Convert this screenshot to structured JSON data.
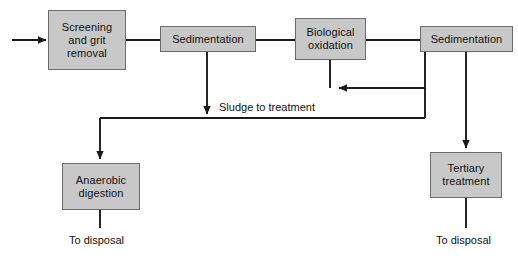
{
  "diagram": {
    "colors": {
      "box_fill": "#c8c8c8",
      "box_border": "#6b6b6b",
      "line": "#1a1a1a",
      "text": "#111111",
      "background": "#ffffff"
    },
    "nodes": [
      {
        "id": "screening-and-grit-removal",
        "label": "Screening\nand grit\nremoval",
        "x": 48,
        "y": 10,
        "w": 78,
        "h": 60
      },
      {
        "id": "sedimentation-primary",
        "label": "Sedimentation",
        "x": 160,
        "y": 26,
        "w": 96,
        "h": 26
      },
      {
        "id": "biological-oxidation",
        "label": "Biological\noxidation",
        "x": 295,
        "y": 18,
        "w": 71,
        "h": 42
      },
      {
        "id": "sedimentation-secondary",
        "label": "Sedimentation",
        "x": 420,
        "y": 26,
        "w": 93,
        "h": 26
      },
      {
        "id": "anaerobic-digestion",
        "label": "Anaerobic\ndigestion",
        "x": 62,
        "y": 163,
        "w": 78,
        "h": 47
      },
      {
        "id": "tertiary-treatment",
        "label": "Tertiary\ntreatment",
        "x": 430,
        "y": 152,
        "w": 72,
        "h": 46
      }
    ],
    "edge_labels": [
      {
        "id": "sludge-to-treatment",
        "text": "Sludge to treatment",
        "x": 219,
        "y": 101
      },
      {
        "id": "to-disposal-left",
        "text": "To disposal",
        "x": 69,
        "y": 234
      },
      {
        "id": "to-disposal-right",
        "text": "To disposal",
        "x": 436,
        "y": 234
      }
    ],
    "connections": [
      {
        "id": "influent-inlet",
        "from": "influent",
        "to": "screening-and-grit-removal",
        "arrow": true
      },
      {
        "id": "screening-to-sedimentation",
        "from": "screening-and-grit-removal",
        "to": "sedimentation-primary",
        "arrow": false
      },
      {
        "id": "sedimentation-to-biological",
        "from": "sedimentation-primary",
        "to": "biological-oxidation",
        "arrow": false
      },
      {
        "id": "biological-to-sedimentation2",
        "from": "biological-oxidation",
        "to": "sedimentation-secondary",
        "arrow": false
      },
      {
        "id": "return-sludge-recycle",
        "from": "sedimentation-secondary",
        "to": "biological-oxidation",
        "arrow": true
      },
      {
        "id": "primary-sludge-down",
        "from": "sedimentation-primary",
        "to": "sludge-header",
        "arrow": true
      },
      {
        "id": "secondary-sludge-down",
        "from": "sedimentation-secondary",
        "to": "sludge-header",
        "arrow": false
      },
      {
        "id": "sludge-to-anaerobic",
        "from": "sludge-header",
        "to": "anaerobic-digestion",
        "arrow": true
      },
      {
        "id": "sedimentation2-to-tertiary",
        "from": "sedimentation-secondary",
        "to": "tertiary-treatment",
        "arrow": true
      },
      {
        "id": "anaerobic-to-disposal",
        "from": "anaerobic-digestion",
        "to": "to-disposal-left",
        "arrow": false
      },
      {
        "id": "tertiary-to-disposal",
        "from": "tertiary-treatment",
        "to": "to-disposal-right",
        "arrow": false
      }
    ]
  }
}
